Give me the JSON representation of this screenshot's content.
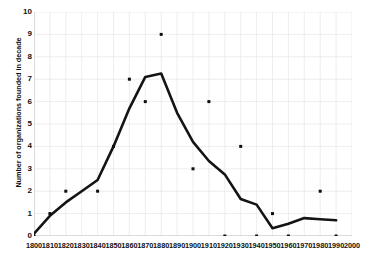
{
  "chart_data": {
    "type": "line",
    "title": "",
    "xlabel": "",
    "ylabel": "Number of organizations founded in decade",
    "xlim": [
      1800,
      2000
    ],
    "ylim": [
      0,
      10
    ],
    "xticks": [
      1800,
      1810,
      1820,
      1830,
      1840,
      1850,
      1860,
      1870,
      1880,
      1890,
      1900,
      1910,
      1920,
      1930,
      1940,
      1950,
      1960,
      1970,
      1980,
      1990,
      2000
    ],
    "yticks": [
      0,
      1,
      2,
      3,
      4,
      5,
      6,
      7,
      8,
      9,
      10
    ],
    "grid": true,
    "legend": "none",
    "line_color": "#141414",
    "marker_color": "#101010",
    "grid_color": "#e9e9ec",
    "series": [
      {
        "name": "trend line",
        "x": [
          1800,
          1810,
          1820,
          1830,
          1840,
          1850,
          1860,
          1870,
          1880,
          1890,
          1900,
          1910,
          1920,
          1930,
          1940,
          1950,
          1960,
          1970,
          1980,
          1990
        ],
        "values": [
          0.1,
          0.9,
          1.5,
          2.0,
          2.5,
          4.0,
          5.7,
          7.1,
          7.25,
          5.5,
          4.2,
          3.35,
          2.75,
          1.65,
          1.4,
          0.35,
          0.55,
          0.8,
          0.75,
          0.7
        ]
      },
      {
        "name": "decade points",
        "x": [
          1800,
          1810,
          1820,
          1840,
          1850,
          1860,
          1870,
          1880,
          1900,
          1910,
          1920,
          1930,
          1940,
          1950,
          1960,
          1980,
          1990
        ],
        "values": [
          0,
          1,
          2,
          2,
          4,
          7,
          6,
          9,
          3,
          6,
          0,
          4,
          0,
          1,
          0,
          2,
          0
        ]
      }
    ]
  },
  "axis": {
    "y_tick_labels": [
      "10",
      "9",
      "8",
      "7",
      "6",
      "5",
      "4",
      "3",
      "2",
      "1",
      "0"
    ],
    "x_tick_labels": [
      "1800",
      "1810",
      "1820",
      "1830",
      "1840",
      "1850",
      "1860",
      "1870",
      "1880",
      "1890",
      "1900",
      "1910",
      "1920",
      "1930",
      "1940",
      "1950",
      "1960",
      "1970",
      "1980",
      "1990",
      "2000"
    ],
    "y_title": "Number of organizations founded in decade"
  }
}
